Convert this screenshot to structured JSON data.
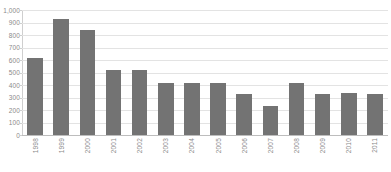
{
  "chart_data": {
    "type": "bar",
    "title": "",
    "xlabel": "",
    "ylabel": "",
    "categories": [
      "1998",
      "1999",
      "2000",
      "2001",
      "2002",
      "2003",
      "2004",
      "2005",
      "2006",
      "2007",
      "2008",
      "2009",
      "2010",
      "2011"
    ],
    "values": [
      615,
      930,
      840,
      520,
      520,
      415,
      415,
      420,
      330,
      235,
      415,
      330,
      335,
      330
    ],
    "ylim": [
      0,
      1000
    ],
    "yticks": [
      0,
      100,
      200,
      300,
      400,
      500,
      600,
      700,
      800,
      900,
      1000
    ],
    "ytick_labels": [
      "0",
      "100",
      "200",
      "300",
      "400",
      "500",
      "600",
      "700",
      "800",
      "900",
      "1,000"
    ],
    "grid": true,
    "legend": false,
    "series_color": "#737373",
    "grid_color": "#e3e3e3",
    "axis_color": "#cfcfcf",
    "label_color": "#8a8a8a"
  }
}
